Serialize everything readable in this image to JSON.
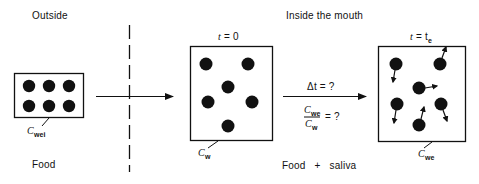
{
  "diagram": {
    "regions": {
      "outside": {
        "label": "Outside",
        "bottom_label": "Food"
      },
      "inside": {
        "label": "Inside the mouth",
        "bottom_label": "Food + saliva"
      }
    },
    "stages": [
      {
        "id": "food-outside",
        "concentration_symbol": "C",
        "concentration_sub": "wei",
        "particles": 6,
        "time_label": ""
      },
      {
        "id": "initial",
        "time_symbol": "t",
        "time_value": "= 0",
        "concentration_symbol": "C",
        "concentration_sub": "w",
        "particles": 6
      },
      {
        "id": "equilibrium",
        "time_symbol": "t",
        "time_value": "= t",
        "time_sub": "e",
        "concentration_symbol": "C",
        "concentration_sub": "we",
        "particles": 6
      }
    ],
    "transition": {
      "delta_t": "Δt = ?",
      "ratio_num_symbol": "C",
      "ratio_num_sub": "we",
      "ratio_den_symbol": "C",
      "ratio_den_sub": "w",
      "ratio_eq": "= ?"
    },
    "colors": {
      "ink": "#111111",
      "background": "#ffffff"
    }
  }
}
